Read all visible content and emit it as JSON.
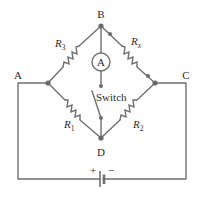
{
  "diagram": {
    "type": "Wheatstone bridge circuit",
    "nodes": {
      "A": {
        "label": "A"
      },
      "B": {
        "label": "B"
      },
      "C": {
        "label": "C"
      },
      "D": {
        "label": "D"
      }
    },
    "resistors": [
      {
        "id": "R3",
        "base": "R",
        "subscript": "3",
        "between": [
          "A",
          "B"
        ]
      },
      {
        "id": "Rx",
        "base": "R",
        "subscript": "x",
        "between": [
          "B",
          "C"
        ]
      },
      {
        "id": "R1",
        "base": "R",
        "subscript": "1",
        "between": [
          "A",
          "D"
        ]
      },
      {
        "id": "R2",
        "base": "R",
        "subscript": "2",
        "between": [
          "D",
          "C"
        ]
      }
    ],
    "ammeter": {
      "symbol": "A",
      "between": [
        "B",
        "switch"
      ]
    },
    "switch": {
      "label": "Switch",
      "state": "open",
      "between": [
        "ammeter",
        "D"
      ]
    },
    "battery": {
      "positive": "+",
      "negative": "−",
      "between": [
        "A",
        "C"
      ]
    },
    "colors": {
      "wire": "#6f6f6f",
      "node": "#6a6a6a",
      "text": "#2a2a2a",
      "background": "#ffffff"
    }
  }
}
